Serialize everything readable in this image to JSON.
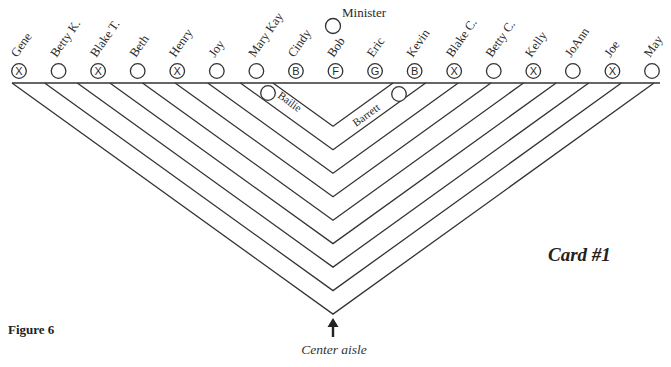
{
  "figure_label": "Figure 6",
  "card_label": "Card #1",
  "aisle_label": "Center aisle",
  "minister": {
    "label": "Minister",
    "mark": ""
  },
  "seats": [
    {
      "name": "Gene",
      "mark": "X"
    },
    {
      "name": "Betty K.",
      "mark": ""
    },
    {
      "name": "Blake T.",
      "mark": "X"
    },
    {
      "name": "Beth",
      "mark": ""
    },
    {
      "name": "Henry",
      "mark": "X"
    },
    {
      "name": "Joy",
      "mark": ""
    },
    {
      "name": "Mary Kay",
      "mark": ""
    },
    {
      "name": "Cindy",
      "mark": "B"
    },
    {
      "name": "Bob",
      "mark": "F"
    },
    {
      "name": "Eric",
      "mark": "G"
    },
    {
      "name": "Kevin",
      "mark": "B"
    },
    {
      "name": "Blake C.",
      "mark": "X"
    },
    {
      "name": "Betty C.",
      "mark": ""
    },
    {
      "name": "Kelly",
      "mark": "X"
    },
    {
      "name": "JoAnn",
      "mark": ""
    },
    {
      "name": "Joe",
      "mark": "X"
    },
    {
      "name": "May",
      "mark": ""
    }
  ],
  "row_seats": [
    {
      "name": "Bailie",
      "side": "left"
    },
    {
      "name": "Barrett",
      "side": "right"
    }
  ],
  "rows_count": 9,
  "legend_marks": {
    "X": "crossed",
    "B": "B",
    "F": "F",
    "G": "G"
  }
}
